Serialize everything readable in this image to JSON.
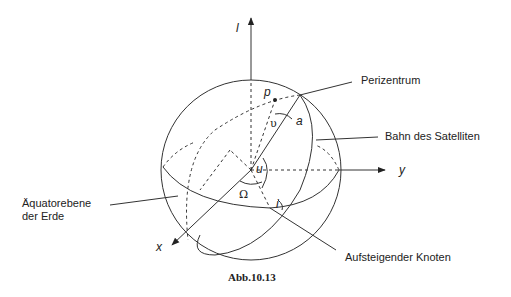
{
  "figure": {
    "caption": "Abb.10.13",
    "axes": {
      "z_label": "l",
      "y_label": "y",
      "x_label": "x"
    },
    "symbols": {
      "p": "p",
      "a": "a",
      "nu": "υ",
      "u": "u",
      "omega": "Ω",
      "i": "i"
    },
    "labels": {
      "perigee": "Perizentrum",
      "orbit": "Bahn des Satelliten",
      "equator_line1": "Äquatorebene",
      "equator_line2": "der Erde",
      "ascending_node": "Aufsteigender Knoten"
    },
    "colors": {
      "stroke": "#333333",
      "background": "#ffffff"
    }
  }
}
